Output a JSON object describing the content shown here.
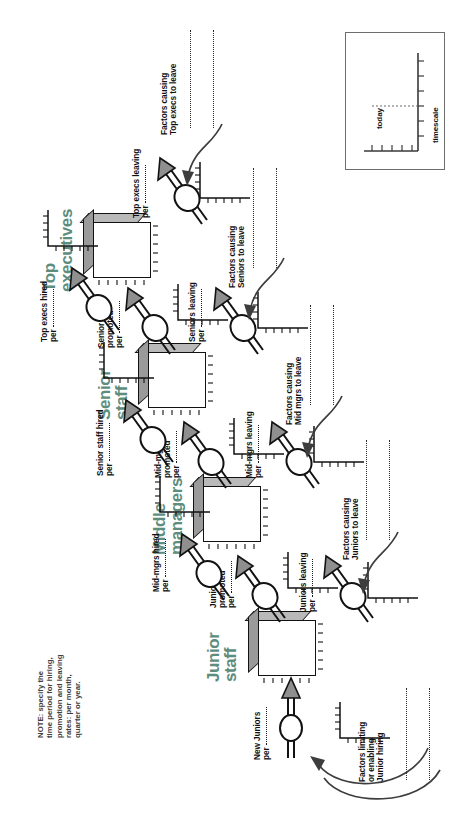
{
  "diagram": {
    "accent_color": "#5d8d7d",
    "line_color": "#121212",
    "note": {
      "line1": "NOTE: specify the",
      "line2": "time period for hiring,",
      "line3": "promotion and leaving",
      "line4": "rates: per month,",
      "line5": "quarter or year."
    },
    "legend": {
      "today_label": "today",
      "timescale_label": "timescale"
    },
    "stocks": [
      {
        "id": "junior-staff",
        "line1": "Junior",
        "line2": "staff"
      },
      {
        "id": "middle-managers",
        "line1": "Middle",
        "line2": "managers"
      },
      {
        "id": "senior-staff",
        "line1": "Senior",
        "line2": "staff"
      },
      {
        "id": "top-executives",
        "line1": "Top",
        "line2": "executives"
      }
    ],
    "flows": [
      {
        "id": "new-juniors",
        "line1": "New Juniors",
        "line2": "",
        "per": "per"
      },
      {
        "id": "juniors-promoted",
        "line1": "Juniors",
        "line2": "promoted",
        "per": "per"
      },
      {
        "id": "juniors-leaving",
        "line1": "Juniors leaving",
        "line2": "",
        "per": "per"
      },
      {
        "id": "mid-mgrs-hired",
        "line1": "Mid-mgrs hired",
        "line2": "",
        "per": "per"
      },
      {
        "id": "mid-mgrs-promoted",
        "line1": "Mid-mgrs",
        "line2": "promoted",
        "per": "per"
      },
      {
        "id": "mid-mgrs-leaving",
        "line1": "Mid-mgrs leaving",
        "line2": "",
        "per": "per"
      },
      {
        "id": "senior-staff-hired",
        "line1": "Senior staff hired",
        "line2": "",
        "per": "per"
      },
      {
        "id": "senior-staff-promoted",
        "line1": "Senior staff",
        "line2": "promoted",
        "per": "per"
      },
      {
        "id": "seniors-leaving",
        "line1": "Seniors leaving",
        "line2": "",
        "per": "per"
      },
      {
        "id": "top-execs-hired",
        "line1": "Top execs hired",
        "line2": "",
        "per": "per"
      },
      {
        "id": "top-execs-leaving",
        "line1": "Top execs leaving",
        "line2": "",
        "per": "per"
      }
    ],
    "factors": [
      {
        "id": "junior-hiring",
        "line1": "Factors limiting",
        "line2": "or enabling",
        "line3": "Junior hiring"
      },
      {
        "id": "juniors-leave",
        "line1": "Factors causing",
        "line2": "Juniors to leave",
        "line3": ""
      },
      {
        "id": "mid-mgrs-leave",
        "line1": "Factors causing",
        "line2": "Mid mgrs to leave",
        "line3": ""
      },
      {
        "id": "seniors-leave",
        "line1": "Factors causing",
        "line2": "Seniors to leave",
        "line3": ""
      },
      {
        "id": "top-execs-leave",
        "line1": "Factors causing",
        "line2": "Top execs to leave",
        "line3": ""
      }
    ]
  }
}
